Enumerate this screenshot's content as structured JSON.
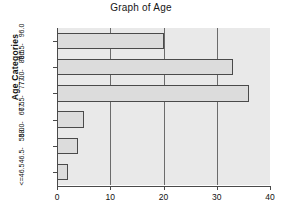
{
  "chart_data": {
    "type": "bar",
    "orientation": "horizontal",
    "title": "Graph of Age",
    "xlabel": "",
    "ylabel": "Age Categories",
    "xlim": [
      0,
      40
    ],
    "xticks": [
      0,
      10,
      20,
      30,
      40
    ],
    "xtick_labels": [
      "0",
      "10",
      "20",
      "30",
      "40"
    ],
    "grid": true,
    "gridlines_at": [
      10,
      20,
      30
    ],
    "legend": false,
    "categories": [
      "<=46.5",
      "46.5 - 58.0",
      "58.0 - 67.5",
      "67.5 - 77.0",
      "77.0 - 86.5",
      "86.5 - 96.0"
    ],
    "category_labels": [
      {
        "low": "<=46.5",
        "high": ""
      },
      {
        "low": "46.5-",
        "high": "58.0"
      },
      {
        "low": "58.0-",
        "high": "67.5"
      },
      {
        "low": "67.5-",
        "high": "77.0"
      },
      {
        "low": "77.0-",
        "high": "86.5"
      },
      {
        "low": "86.5-",
        "high": "96.0"
      }
    ],
    "values": [
      2,
      4,
      5,
      36,
      33,
      20
    ],
    "bars": [
      {
        "category": "<=46.5",
        "value": 2
      },
      {
        "category": "46.5 - 58.0",
        "value": 4
      },
      {
        "category": "58.0 - 67.5",
        "value": 5
      },
      {
        "category": "67.5 - 77.0",
        "value": 36
      },
      {
        "category": "77.0 - 86.5",
        "value": 33
      },
      {
        "category": "86.5 - 96.0",
        "value": 20
      }
    ],
    "colors": {
      "bar_fill": "#dcdcdc",
      "bar_border": "#4a4a4a",
      "plot_background": "#e9e9e9",
      "gridline": "#6b6b6b",
      "axis": "#4a4a4a",
      "text": "#111111",
      "figure_background": "#ffffff"
    }
  }
}
